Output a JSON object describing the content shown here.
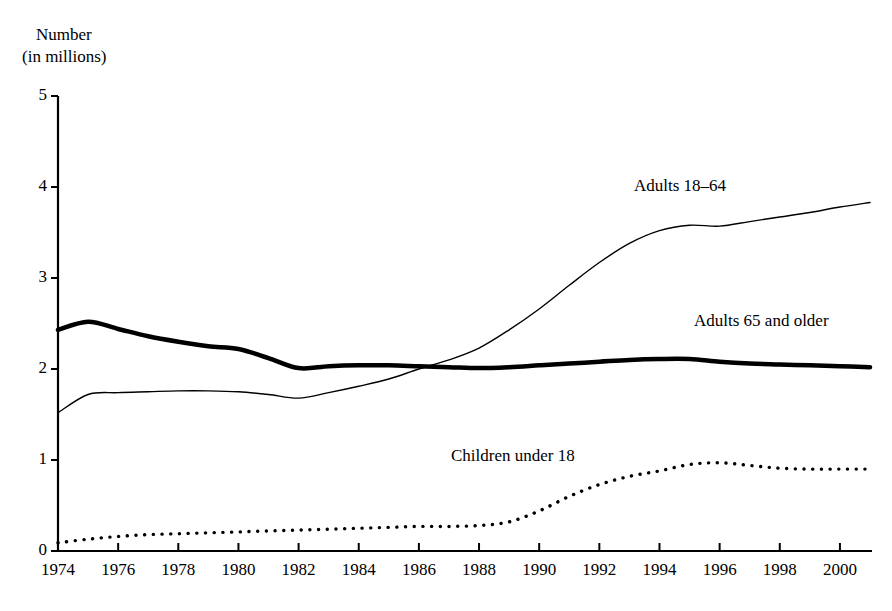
{
  "axis": {
    "y_title_line1": "Number",
    "y_title_line2": "(in millions)",
    "y_ticks": [
      "5",
      "4",
      "3",
      "2",
      "1",
      "0"
    ],
    "x_ticks": [
      "1974",
      "1976",
      "1978",
      "1980",
      "1982",
      "1984",
      "1986",
      "1988",
      "1990",
      "1992",
      "1994",
      "1996",
      "1998",
      "2000"
    ]
  },
  "labels": {
    "adults_18_64": "Adults 18–64",
    "adults_65_older": "Adults 65 and older",
    "children_under_18": "Children under 18"
  },
  "colors": {
    "line": "#000000",
    "background": "#ffffff"
  },
  "chart_data": {
    "type": "line",
    "title": "",
    "subtitle": "",
    "xlabel": "",
    "ylabel": "Number (in millions)",
    "xlim": [
      1974,
      2001
    ],
    "ylim": [
      0,
      5
    ],
    "ytick_values": [
      0,
      1,
      2,
      3,
      4,
      5
    ],
    "xtick_values": [
      1974,
      1976,
      1978,
      1980,
      1982,
      1984,
      1986,
      1988,
      1990,
      1992,
      1994,
      1996,
      1998,
      2000
    ],
    "grid": false,
    "legend": "inline-labels",
    "x": [
      1974,
      1975,
      1976,
      1977,
      1978,
      1979,
      1980,
      1981,
      1982,
      1983,
      1984,
      1985,
      1986,
      1987,
      1988,
      1989,
      1990,
      1991,
      1992,
      1993,
      1994,
      1995,
      1996,
      1997,
      1998,
      1999,
      2000,
      2001
    ],
    "series": [
      {
        "name": "Adults 18–64",
        "style": "thin-solid",
        "linewidth": 1.4,
        "values": [
          1.52,
          1.72,
          1.74,
          1.75,
          1.76,
          1.76,
          1.75,
          1.72,
          1.68,
          1.74,
          1.81,
          1.89,
          2.0,
          2.1,
          2.23,
          2.43,
          2.66,
          2.92,
          3.17,
          3.38,
          3.52,
          3.58,
          3.57,
          3.62,
          3.67,
          3.72,
          3.78,
          3.83
        ]
      },
      {
        "name": "Adults 65 and older",
        "style": "thick-solid",
        "linewidth": 4.5,
        "values": [
          2.43,
          2.52,
          2.44,
          2.36,
          2.3,
          2.25,
          2.22,
          2.12,
          2.01,
          2.03,
          2.04,
          2.04,
          2.03,
          2.02,
          2.01,
          2.02,
          2.04,
          2.06,
          2.08,
          2.1,
          2.11,
          2.11,
          2.08,
          2.06,
          2.05,
          2.04,
          2.03,
          2.02
        ]
      },
      {
        "name": "Children under 18",
        "style": "dotted",
        "linewidth": 3.4,
        "values": [
          0.09,
          0.13,
          0.16,
          0.18,
          0.19,
          0.2,
          0.21,
          0.22,
          0.23,
          0.24,
          0.25,
          0.26,
          0.27,
          0.27,
          0.28,
          0.32,
          0.44,
          0.6,
          0.73,
          0.82,
          0.88,
          0.95,
          0.97,
          0.94,
          0.91,
          0.9,
          0.9,
          0.9
        ]
      }
    ]
  }
}
